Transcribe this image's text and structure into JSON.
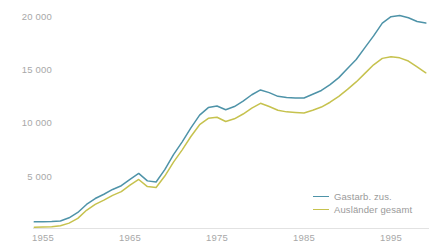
{
  "chart_data": {
    "type": "line",
    "title": "",
    "subtitle": "",
    "xlabel": "",
    "ylabel": "",
    "xlim": [
      1954,
      1999
    ],
    "ylim": [
      0,
      21500
    ],
    "grid": false,
    "legend_position": "bottom-right",
    "x_ticks": [
      "1955",
      "1965",
      "1975",
      "1985",
      "1995"
    ],
    "x_tick_values": [
      1955,
      1965,
      1975,
      1985,
      1995
    ],
    "y_ticks": [
      "5 000",
      "10 000",
      "15 000",
      "20 000"
    ],
    "y_tick_values": [
      5000,
      10000,
      15000,
      20000
    ],
    "x": [
      1954,
      1955,
      1956,
      1957,
      1958,
      1959,
      1960,
      1961,
      1962,
      1963,
      1964,
      1965,
      1966,
      1967,
      1968,
      1969,
      1970,
      1971,
      1972,
      1973,
      1974,
      1975,
      1976,
      1977,
      1978,
      1979,
      1980,
      1981,
      1982,
      1983,
      1984,
      1985,
      1986,
      1987,
      1988,
      1989,
      1990,
      1991,
      1992,
      1993,
      1994,
      1995,
      1996,
      1997,
      1998,
      1999
    ],
    "series": [
      {
        "name": "Gastarb. zus.",
        "color": "#4e93a8",
        "values": [
          620,
          630,
          650,
          700,
          1000,
          1500,
          2250,
          2800,
          3200,
          3650,
          4000,
          4600,
          5150,
          4450,
          4350,
          5500,
          6900,
          8100,
          9400,
          10600,
          11300,
          11450,
          11100,
          11400,
          11900,
          12500,
          12950,
          12700,
          12350,
          12250,
          12200,
          12200,
          12550,
          12900,
          13450,
          14100,
          14950,
          15800,
          16900,
          18000,
          19200,
          19800,
          19900,
          19700,
          19350,
          19200
        ]
      },
      {
        "name": "Ausländer gesamt",
        "color": "#c6c24e",
        "values": [
          120,
          140,
          170,
          250,
          500,
          950,
          1700,
          2250,
          2650,
          3100,
          3450,
          4050,
          4580,
          3920,
          3830,
          4900,
          6200,
          7350,
          8600,
          9700,
          10300,
          10400,
          10000,
          10250,
          10700,
          11250,
          11700,
          11400,
          11050,
          10900,
          10850,
          10800,
          11050,
          11350,
          11800,
          12350,
          13000,
          13700,
          14500,
          15300,
          15900,
          16050,
          15950,
          15650,
          15100,
          14550
        ]
      }
    ]
  },
  "legend": {
    "items": [
      {
        "label": "Gastarb. zus.",
        "color": "#4e93a8"
      },
      {
        "label": "Ausländer gesamt",
        "color": "#c6c24e"
      }
    ]
  }
}
